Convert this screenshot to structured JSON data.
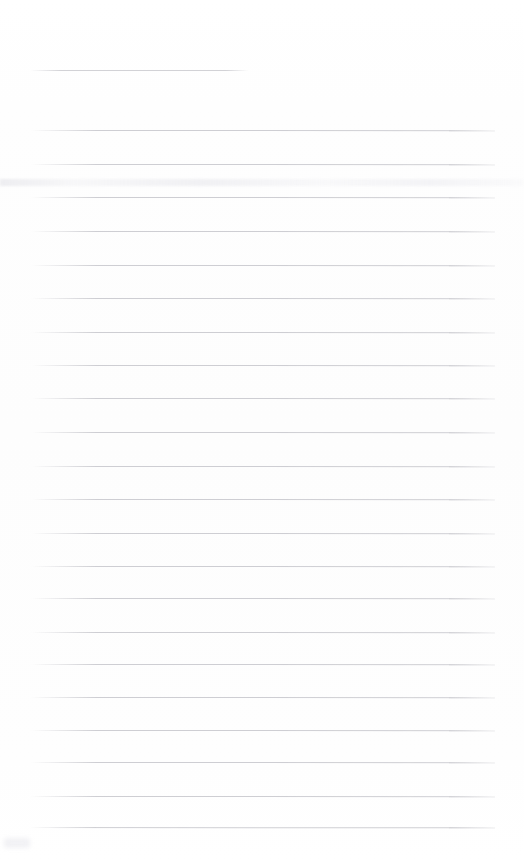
{
  "document": {
    "type": "scanned-ruled-paper",
    "title": "Blank Ruled Notebook Page",
    "state": "blank",
    "content_text": "",
    "page_width": 524,
    "page_height": 864,
    "background_color": "#fefefe",
    "rule_color": "#cbcbd0",
    "rule_left_margin": 31,
    "rule_right_edge": 495,
    "rule_thickness": 1,
    "rule_spacing": 34,
    "total_rules": 23
  },
  "rules": [
    {
      "id": "rule-1",
      "y": 70,
      "x": 31,
      "width": 217,
      "kind": "short-heading-rule",
      "slant": 0.3,
      "opacity": 0.85
    },
    {
      "id": "rule-2",
      "y": 130,
      "x": 31,
      "width": 464,
      "kind": "full-rule",
      "slant": 0.6,
      "opacity": 0.92
    },
    {
      "id": "rule-3",
      "y": 164,
      "x": 31,
      "width": 464,
      "kind": "full-rule",
      "slant": 0.6,
      "opacity": 0.92
    },
    {
      "id": "rule-4",
      "y": 197,
      "x": 31,
      "width": 464,
      "kind": "full-rule",
      "slant": 0.5,
      "opacity": 0.92
    },
    {
      "id": "rule-5",
      "y": 231,
      "x": 31,
      "width": 464,
      "kind": "full-rule",
      "slant": 0.6,
      "opacity": 0.92
    },
    {
      "id": "rule-6",
      "y": 265,
      "x": 31,
      "width": 464,
      "kind": "full-rule",
      "slant": 0.5,
      "opacity": 0.92
    },
    {
      "id": "rule-7",
      "y": 298,
      "x": 31,
      "width": 464,
      "kind": "full-rule",
      "slant": 0.6,
      "opacity": 0.92
    },
    {
      "id": "rule-8",
      "y": 332,
      "x": 31,
      "width": 464,
      "kind": "full-rule",
      "slant": 0.5,
      "opacity": 0.92
    },
    {
      "id": "rule-9",
      "y": 365,
      "x": 31,
      "width": 464,
      "kind": "full-rule",
      "slant": 0.6,
      "opacity": 0.92
    },
    {
      "id": "rule-10",
      "y": 398,
      "x": 31,
      "width": 464,
      "kind": "full-rule",
      "slant": 0.5,
      "opacity": 0.92
    },
    {
      "id": "rule-11",
      "y": 432,
      "x": 31,
      "width": 464,
      "kind": "full-rule",
      "slant": 0.6,
      "opacity": 0.92
    },
    {
      "id": "rule-12",
      "y": 466,
      "x": 31,
      "width": 464,
      "kind": "full-rule",
      "slant": 0.5,
      "opacity": 0.92
    },
    {
      "id": "rule-13",
      "y": 499,
      "x": 31,
      "width": 464,
      "kind": "full-rule",
      "slant": 0.6,
      "opacity": 0.92
    },
    {
      "id": "rule-14",
      "y": 533,
      "x": 31,
      "width": 464,
      "kind": "full-rule",
      "slant": 0.5,
      "opacity": 0.92
    },
    {
      "id": "rule-15",
      "y": 566,
      "x": 31,
      "width": 464,
      "kind": "full-rule",
      "slant": 0.6,
      "opacity": 0.92
    },
    {
      "id": "rule-16",
      "y": 598,
      "x": 31,
      "width": 464,
      "kind": "full-rule",
      "slant": 0.5,
      "opacity": 0.92
    },
    {
      "id": "rule-17",
      "y": 632,
      "x": 31,
      "width": 464,
      "kind": "full-rule",
      "slant": 0.6,
      "opacity": 0.92
    },
    {
      "id": "rule-18",
      "y": 664,
      "x": 31,
      "width": 464,
      "kind": "full-rule",
      "slant": 0.5,
      "opacity": 0.92
    },
    {
      "id": "rule-19",
      "y": 697,
      "x": 31,
      "width": 464,
      "kind": "full-rule",
      "slant": 0.6,
      "opacity": 0.92
    },
    {
      "id": "rule-20",
      "y": 730,
      "x": 31,
      "width": 464,
      "kind": "full-rule",
      "slant": 0.5,
      "opacity": 0.92
    },
    {
      "id": "rule-21",
      "y": 762,
      "x": 31,
      "width": 464,
      "kind": "full-rule",
      "slant": 0.6,
      "opacity": 0.92
    },
    {
      "id": "rule-22",
      "y": 796,
      "x": 31,
      "width": 464,
      "kind": "full-rule",
      "slant": 0.5,
      "opacity": 0.92
    },
    {
      "id": "rule-23",
      "y": 827,
      "x": 31,
      "width": 464,
      "kind": "full-rule",
      "slant": 0.7,
      "opacity": 0.92
    }
  ],
  "artifacts": [
    {
      "id": "smudge-band",
      "kind": "scan-smudge-band",
      "y": 179,
      "x": 0,
      "width": 524,
      "height": 7
    },
    {
      "id": "smudge-corner",
      "kind": "scan-smudge-spot",
      "y": 838,
      "x": 4,
      "width": 26,
      "height": 10
    }
  ]
}
